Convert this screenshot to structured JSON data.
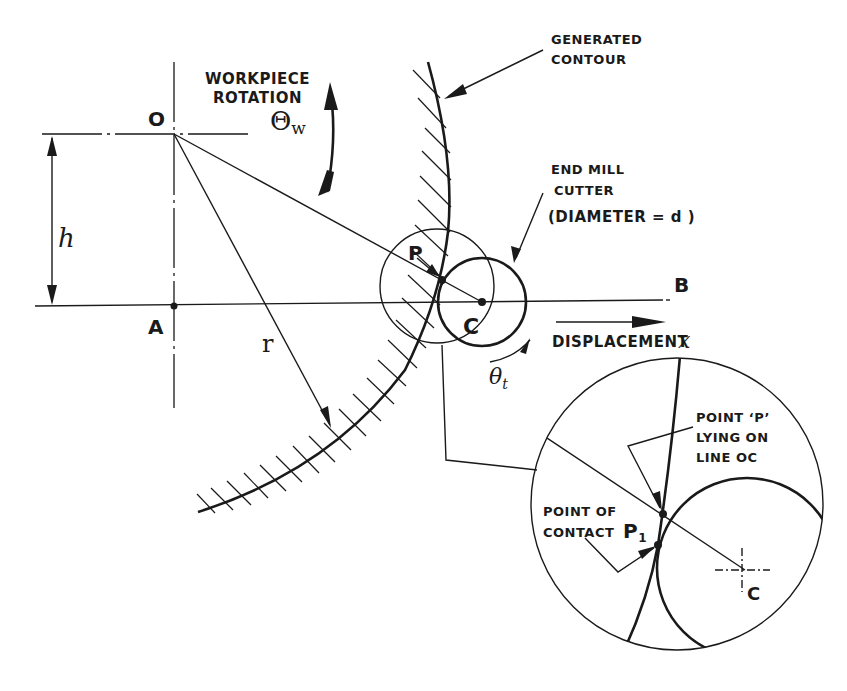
{
  "diagram": {
    "colors": {
      "ink": "#1a1a1a",
      "background": "#ffffff"
    },
    "points": {
      "O": "O",
      "A": "A",
      "B": "B",
      "C": "C",
      "P": "P",
      "C_detail": "C",
      "P1_base": "P",
      "P1_sub": "1"
    },
    "symbols": {
      "h": "h",
      "r": "r",
      "theta_w_base": "Θ",
      "theta_w_sub": "w",
      "theta_t_base": "θ",
      "theta_t_sub": "t",
      "x": "x"
    },
    "labels": {
      "workpiece_rotation_line1": "WORKPIECE",
      "workpiece_rotation_line2": "ROTATION",
      "generated_contour_line1": "GENERATED",
      "generated_contour_line2": "CONTOUR",
      "end_mill_line1": "END MILL",
      "end_mill_line2": "CUTTER",
      "end_mill_line3": "(DIAMETER = d )",
      "displacement": "DISPLACEMENT",
      "point_p_line1": "POINT ‘P’",
      "point_p_line2": "LYING ON",
      "point_p_line3": "LINE OC",
      "point_contact_line1": "POINT OF",
      "point_contact_line2": "CONTACT"
    }
  }
}
